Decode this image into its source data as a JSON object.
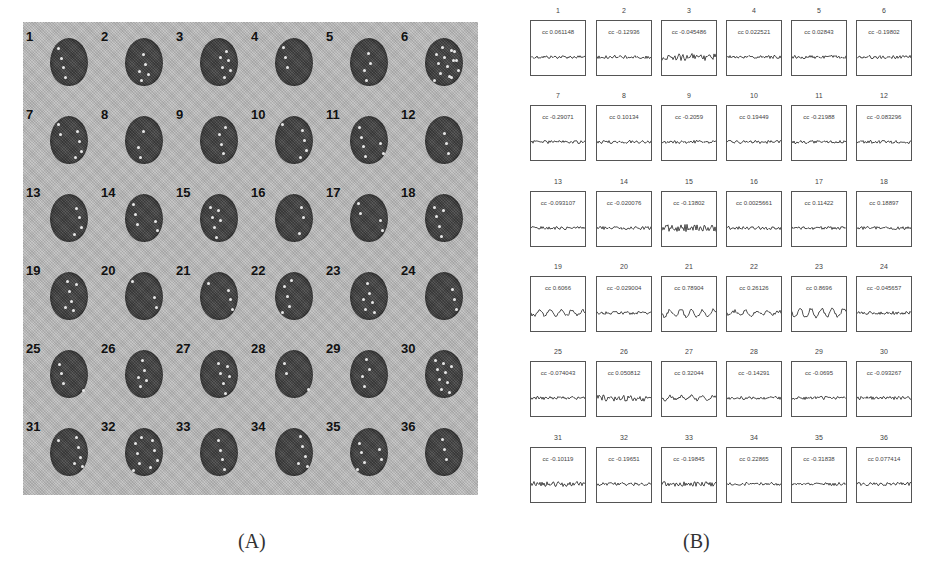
{
  "panel_a": {
    "caption": "(A)",
    "slices": [
      {
        "n": "1"
      },
      {
        "n": "2"
      },
      {
        "n": "3"
      },
      {
        "n": "4"
      },
      {
        "n": "5"
      },
      {
        "n": "6"
      },
      {
        "n": "7"
      },
      {
        "n": "8"
      },
      {
        "n": "9"
      },
      {
        "n": "10"
      },
      {
        "n": "11"
      },
      {
        "n": "12"
      },
      {
        "n": "13"
      },
      {
        "n": "14"
      },
      {
        "n": "15"
      },
      {
        "n": "16"
      },
      {
        "n": "17"
      },
      {
        "n": "18"
      },
      {
        "n": "19"
      },
      {
        "n": "20"
      },
      {
        "n": "21"
      },
      {
        "n": "22"
      },
      {
        "n": "23"
      },
      {
        "n": "24"
      },
      {
        "n": "25"
      },
      {
        "n": "26"
      },
      {
        "n": "27"
      },
      {
        "n": "28"
      },
      {
        "n": "29"
      },
      {
        "n": "30"
      },
      {
        "n": "31"
      },
      {
        "n": "32"
      },
      {
        "n": "33"
      },
      {
        "n": "34"
      },
      {
        "n": "35"
      },
      {
        "n": "36"
      }
    ]
  },
  "panel_b": {
    "caption": "(B)",
    "plots": [
      {
        "n": "1",
        "cc": "cc 0.061148"
      },
      {
        "n": "2",
        "cc": "cc -0.12936"
      },
      {
        "n": "3",
        "cc": "cc -0.045486"
      },
      {
        "n": "4",
        "cc": "cc 0.022521"
      },
      {
        "n": "5",
        "cc": "cc 0.02843"
      },
      {
        "n": "6",
        "cc": "cc -0.19802"
      },
      {
        "n": "7",
        "cc": "cc -0.29071"
      },
      {
        "n": "8",
        "cc": "cc 0.10134"
      },
      {
        "n": "9",
        "cc": "cc -0.2059"
      },
      {
        "n": "10",
        "cc": "cc 0.19449"
      },
      {
        "n": "11",
        "cc": "cc -0.21988"
      },
      {
        "n": "12",
        "cc": "cc -0.083296"
      },
      {
        "n": "13",
        "cc": "cc -0.093107"
      },
      {
        "n": "14",
        "cc": "cc -0.020076"
      },
      {
        "n": "15",
        "cc": "cc -0.13802"
      },
      {
        "n": "16",
        "cc": "cc 0.0025661"
      },
      {
        "n": "17",
        "cc": "cc 0.11422"
      },
      {
        "n": "18",
        "cc": "cc 0.18897"
      },
      {
        "n": "19",
        "cc": "cc 0.6066"
      },
      {
        "n": "20",
        "cc": "cc -0.029004"
      },
      {
        "n": "21",
        "cc": "cc 0.78904"
      },
      {
        "n": "22",
        "cc": "cc 0.26126"
      },
      {
        "n": "23",
        "cc": "cc 0.8696"
      },
      {
        "n": "24",
        "cc": "cc -0.045657"
      },
      {
        "n": "25",
        "cc": "cc -0.074043"
      },
      {
        "n": "26",
        "cc": "cc 0.050812"
      },
      {
        "n": "27",
        "cc": "cc 0.32044"
      },
      {
        "n": "28",
        "cc": "cc -0.14291"
      },
      {
        "n": "29",
        "cc": "cc -0.0695"
      },
      {
        "n": "30",
        "cc": "cc -0.093267"
      },
      {
        "n": "31",
        "cc": "cc -0.10119"
      },
      {
        "n": "32",
        "cc": "cc -0.19651"
      },
      {
        "n": "33",
        "cc": "cc -0.19845"
      },
      {
        "n": "34",
        "cc": "cc 0.22865"
      },
      {
        "n": "35",
        "cc": "cc -0.31838"
      },
      {
        "n": "36",
        "cc": "cc 0.077414"
      }
    ]
  },
  "colors": {
    "panel_a_bg": "#b9b9b9",
    "brain": "#4a4a4a",
    "plot_border": "#555555",
    "trace": "#222222"
  }
}
